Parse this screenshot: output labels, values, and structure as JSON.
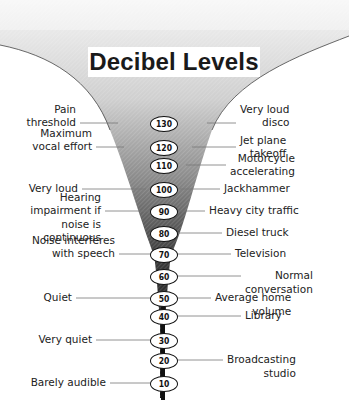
{
  "title": "Decibel Levels",
  "colors": {
    "funnel_light": "#e8e8e8",
    "funnel_dark": "#1a1a1a",
    "badge_fill": "#ffffff",
    "text": "#222222"
  },
  "levels": [
    {
      "db": "130",
      "y": 123
    },
    {
      "db": "120",
      "y": 147
    },
    {
      "db": "110",
      "y": 165
    },
    {
      "db": "100",
      "y": 189
    },
    {
      "db": "90",
      "y": 211
    },
    {
      "db": "80",
      "y": 233
    },
    {
      "db": "70",
      "y": 254
    },
    {
      "db": "60",
      "y": 276
    },
    {
      "db": "50",
      "y": 298
    },
    {
      "db": "40",
      "y": 316
    },
    {
      "db": "30",
      "y": 340
    },
    {
      "db": "20",
      "y": 360
    },
    {
      "db": "10",
      "y": 383
    }
  ],
  "left_labels": [
    {
      "text": "Pain\nthreshold",
      "db": "130"
    },
    {
      "text": "Maximum\nvocal effort",
      "db": "120"
    },
    {
      "text": "Very loud",
      "db": "100"
    },
    {
      "text": "Hearing\nimpairment if\nnoise is\ncontinuous",
      "db": "90"
    },
    {
      "text": "Noise interferes\nwith speech",
      "db": "70"
    },
    {
      "text": "Quiet",
      "db": "50"
    },
    {
      "text": "Very quiet",
      "db": "30"
    },
    {
      "text": "Barely audible",
      "db": "10"
    }
  ],
  "right_labels": [
    {
      "text": "Very loud\ndisco",
      "db": "130"
    },
    {
      "text": "Jet plane\ntakeoff",
      "db": "120"
    },
    {
      "text": "Motorcycle\naccelerating",
      "db": "110"
    },
    {
      "text": "Jackhammer",
      "db": "100"
    },
    {
      "text": "Heavy city traffic",
      "db": "90"
    },
    {
      "text": "Diesel truck",
      "db": "80"
    },
    {
      "text": "Television",
      "db": "70"
    },
    {
      "text": "Normal\nconversation",
      "db": "60"
    },
    {
      "text": "Average home\nvolume",
      "db": "50"
    },
    {
      "text": "Library",
      "db": "40"
    },
    {
      "text": "Broadcasting\nstudio",
      "db": "20"
    }
  ]
}
